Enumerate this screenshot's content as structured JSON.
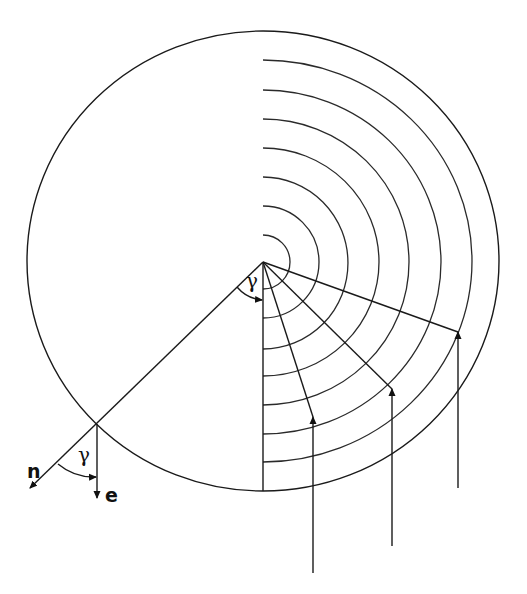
{
  "diagram": {
    "labels": {
      "gamma_center": "γ",
      "gamma_boundary": "γ",
      "normal": "n",
      "direction": "e"
    },
    "center": {
      "x": 263,
      "y": 262
    },
    "outer_circle": {
      "cx": 263,
      "cy": 261,
      "rx": 236,
      "ry": 230
    },
    "arc_radii": [
      27,
      56,
      85,
      114,
      143,
      172,
      201
    ],
    "rays": [
      {
        "name": "normal-ray",
        "from": [
          263,
          262
        ],
        "to": [
          28,
          490
        ]
      },
      {
        "name": "vertical-ray",
        "from": [
          263,
          262
        ],
        "to": [
          263,
          491
        ]
      },
      {
        "name": "ray-1",
        "from": [
          263,
          262
        ],
        "to": [
          313,
          417
        ]
      },
      {
        "name": "ray-2",
        "from": [
          263,
          262
        ],
        "to": [
          392,
          389
        ]
      },
      {
        "name": "ray-3",
        "from": [
          263,
          262
        ],
        "to": [
          458,
          332
        ]
      }
    ],
    "incoming_arrows": [
      {
        "name": "arrow-1",
        "x": 313,
        "tip_y": 417,
        "tail_y": 573
      },
      {
        "name": "arrow-2",
        "x": 392,
        "tip_y": 389,
        "tail_y": 546
      },
      {
        "name": "arrow-3",
        "x": 458,
        "tip_y": 332,
        "tail_y": 488
      }
    ],
    "boundary_point": {
      "x": 97,
      "y": 424
    }
  }
}
